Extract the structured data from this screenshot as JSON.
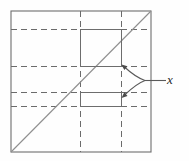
{
  "figure": {
    "type": "geometric-diagram",
    "background_color": "#fefefe",
    "stroke_color": "#5a5a5a",
    "dash_color": "#6b6b6b",
    "diagonal_color": "#8a8a8a",
    "square": {
      "left": 11,
      "top": 11,
      "right": 151,
      "bottom": 152
    },
    "dashed_horizontal_lines": [
      29,
      66,
      92,
      106
    ],
    "dashed_vertical_lines": [
      80,
      121
    ],
    "diagonal": {
      "x1": 11,
      "y1": 152,
      "x2": 151,
      "y2": 11
    },
    "rectangles": [
      {
        "name": "upper-rectangle",
        "x": 80,
        "y": 29,
        "width": 41,
        "height": 37
      },
      {
        "name": "lower-rectangle",
        "x": 80,
        "y": 92,
        "width": 41,
        "height": 14
      }
    ],
    "leader": {
      "junction_x": 145,
      "junction_y": 80,
      "line_end_x": 165,
      "arrow_upper_tip_x": 122,
      "arrow_upper_tip_y": 65,
      "arrow_lower_tip_x": 122,
      "arrow_lower_tip_y": 98
    },
    "labels": {
      "x": "x"
    }
  }
}
